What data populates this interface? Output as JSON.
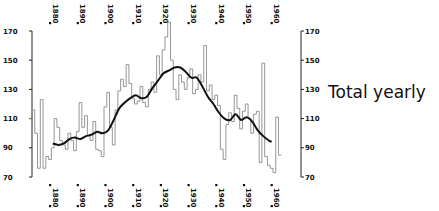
{
  "chart_data": {
    "type": "line",
    "title": "Total yearly",
    "xlabel": "",
    "ylabel": "",
    "ylim": [
      70,
      170
    ],
    "xlim": [
      1873,
      1964
    ],
    "grid": false,
    "legend": "none",
    "y_ticks": [
      70,
      90,
      110,
      130,
      150,
      170
    ],
    "x_ticks": [
      1880,
      1890,
      1900,
      1910,
      1920,
      1930,
      1940,
      1950,
      1960
    ],
    "series": [
      {
        "name": "Yearly total (step)",
        "style": "step",
        "x": [
          1873,
          1874,
          1875,
          1876,
          1877,
          1878,
          1879,
          1880,
          1881,
          1882,
          1883,
          1884,
          1885,
          1886,
          1887,
          1888,
          1889,
          1890,
          1891,
          1892,
          1893,
          1894,
          1895,
          1896,
          1897,
          1898,
          1899,
          1900,
          1901,
          1902,
          1903,
          1904,
          1905,
          1906,
          1907,
          1908,
          1909,
          1910,
          1911,
          1912,
          1913,
          1914,
          1915,
          1916,
          1917,
          1918,
          1919,
          1920,
          1921,
          1922,
          1923,
          1924,
          1925,
          1926,
          1927,
          1928,
          1929,
          1930,
          1931,
          1932,
          1933,
          1934,
          1935,
          1936,
          1937,
          1938,
          1939,
          1940,
          1941,
          1942,
          1943,
          1944,
          1945,
          1946,
          1947,
          1948,
          1949,
          1950,
          1951,
          1952,
          1953,
          1954,
          1955,
          1956,
          1957,
          1958,
          1959,
          1960,
          1961,
          1962,
          1963
        ],
        "values": [
          110,
          116,
          100,
          76,
          123,
          76,
          84,
          82,
          90,
          110,
          104,
          95,
          92,
          89,
          100,
          95,
          88,
          101,
          121,
          104,
          112,
          98,
          95,
          108,
          89,
          88,
          84,
          118,
          128,
          104,
          92,
          116,
          129,
          137,
          132,
          147,
          134,
          124,
          120,
          122,
          132,
          121,
          118,
          130,
          135,
          128,
          153,
          140,
          157,
          166,
          176,
          150,
          130,
          123,
          140,
          135,
          130,
          138,
          144,
          127,
          130,
          140,
          135,
          160,
          129,
          133,
          123,
          126,
          119,
          89,
          82,
          106,
          114,
          108,
          126,
          117,
          103,
          115,
          120,
          110,
          100,
          113,
          115,
          80,
          148,
          84,
          78,
          76,
          73,
          111,
          85
        ],
        "ylim": [
          70,
          170
        ]
      },
      {
        "name": "Smoothed trend",
        "style": "smooth",
        "x": [
          1881,
          1883,
          1885,
          1887,
          1889,
          1891,
          1893,
          1895,
          1897,
          1899,
          1901,
          1903,
          1905,
          1907,
          1909,
          1911,
          1913,
          1915,
          1917,
          1919,
          1921,
          1923,
          1925,
          1927,
          1929,
          1931,
          1933,
          1935,
          1937,
          1939,
          1941,
          1943,
          1945,
          1947,
          1949,
          1951,
          1953,
          1955,
          1957,
          1959,
          1960
        ],
        "values": [
          93,
          92,
          93,
          96,
          97,
          96,
          98,
          99,
          101,
          100,
          102,
          109,
          117,
          121,
          124,
          126,
          124,
          125,
          131,
          136,
          141,
          143,
          145,
          145,
          142,
          138,
          138,
          132,
          125,
          120,
          114,
          110,
          109,
          113,
          109,
          111,
          108,
          102,
          98,
          95,
          94
        ]
      }
    ]
  },
  "axes": {
    "left": {
      "labels": [
        "170",
        "150",
        "130",
        "110",
        "90",
        "70"
      ]
    },
    "right": {
      "labels": [
        "170",
        "150",
        "130",
        "110",
        "90",
        "70"
      ]
    },
    "top_years": [
      "1880",
      "1890",
      "1900",
      "1910",
      "1920",
      "1930",
      "1940",
      "1950",
      "1960"
    ],
    "bottom_years": [
      "1880",
      "1890",
      "1900",
      "1910",
      "1920",
      "1930",
      "1940",
      "1950",
      "1960"
    ]
  },
  "side_title": "Total yearly"
}
